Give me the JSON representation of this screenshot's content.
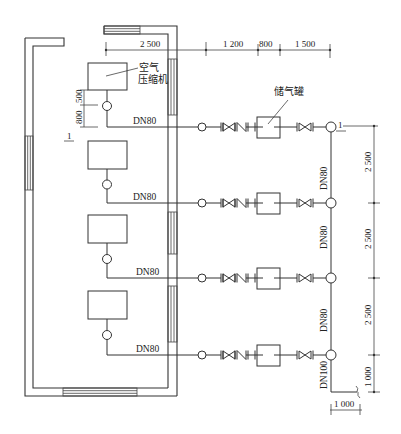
{
  "diagram": {
    "type": "plan",
    "labels": {
      "compressor": "空气压缩机",
      "compressor_line1": "空气",
      "compressor_line2": "压缩机",
      "receiver": "储气罐",
      "section_mark": "1"
    },
    "top_dimensions": [
      "2 500",
      "1 200",
      "800",
      "1 500"
    ],
    "left_dimensions": [
      "800",
      "500"
    ],
    "right_dimensions": [
      "2 500",
      "2 500",
      "2 500",
      "1 000"
    ],
    "bottom_dimension": "1 000",
    "branch_pipe_labels": [
      "DN80",
      "DN80",
      "DN80",
      "DN80"
    ],
    "header_pipe_labels": [
      "DN80",
      "DN80",
      "DN80",
      "DN100"
    ],
    "compressor_units": 4,
    "receiver_units": 4
  }
}
